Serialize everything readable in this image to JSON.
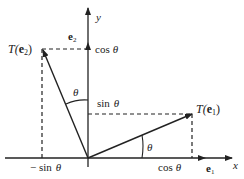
{
  "diagram": {
    "axes": {
      "x_label": "x",
      "y_label": "y"
    },
    "vectors": {
      "e1": {
        "label": "e",
        "sub": "1"
      },
      "e2": {
        "label": "e",
        "sub": "2"
      },
      "T_e1": {
        "prefix": "T(",
        "label": "e",
        "sub": "1",
        "suffix": ")"
      },
      "T_e2": {
        "prefix": "T(",
        "label": "e",
        "sub": "2",
        "suffix": ")"
      }
    },
    "tick_labels": {
      "cos_x": {
        "fn": "cos",
        "arg": "θ"
      },
      "cos_y": {
        "fn": "cos",
        "arg": "θ"
      },
      "sin_y": {
        "fn": "sin",
        "arg": "θ"
      },
      "neg_sin_x": {
        "fn": "− sin",
        "arg": "θ"
      }
    },
    "angles": {
      "theta_upper": "θ",
      "theta_lower": "θ"
    },
    "colors": {
      "line": "#222222",
      "background": "#ffffff"
    }
  }
}
